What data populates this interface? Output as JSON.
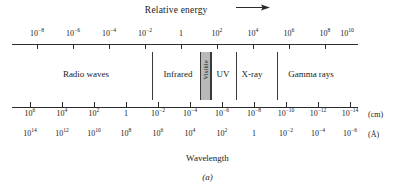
{
  "header": {
    "title": "Relative energy",
    "arrow_icon": "arrow-right-icon"
  },
  "chart_data": {
    "type": "diagram",
    "xlabel": "Wavelength",
    "top_axis": {
      "label": "Relative energy",
      "direction": "increases to the right",
      "tick_labels": [
        "10−8",
        "10−6",
        "10−4",
        "10−2",
        "1",
        "10²",
        "10⁴",
        "10⁶",
        "10⁸",
        "10¹⁰"
      ],
      "tick_bases": [
        "10",
        "10",
        "10",
        "10",
        "1",
        "10",
        "10",
        "10",
        "10",
        "10"
      ],
      "tick_exponents": [
        "-8",
        "-6",
        "-4",
        "-2",
        "",
        "2",
        "4",
        "6",
        "8",
        "10"
      ],
      "tick_x": [
        37,
        73,
        109,
        145,
        181,
        217,
        253,
        289,
        325,
        347
      ]
    },
    "cm_axis": {
      "unit": "(cm)",
      "tick_labels": [
        "10⁶",
        "10⁴",
        "10²",
        "1",
        "10−2",
        "10−4",
        "10−6",
        "10−8",
        "10−10",
        "10−12",
        "10−14"
      ],
      "tick_bases": [
        "10",
        "10",
        "10",
        "1",
        "10",
        "10",
        "10",
        "10",
        "10",
        "10",
        "10"
      ],
      "tick_exponents": [
        "6",
        "4",
        "2",
        "",
        "-2",
        "-4",
        "-6",
        "-8",
        "-10",
        "-12",
        "-14"
      ],
      "tick_x": [
        30,
        62,
        94,
        126,
        158,
        190,
        222,
        254,
        286,
        318,
        350
      ]
    },
    "angstrom_axis": {
      "unit": "(Å)",
      "tick_labels": [
        "10¹⁴",
        "10¹²",
        "10¹⁰",
        "10⁸",
        "10⁶",
        "10⁴",
        "10²",
        "1",
        "10−2",
        "10−4",
        "10−6"
      ],
      "tick_bases": [
        "10",
        "10",
        "10",
        "10",
        "10",
        "10",
        "10",
        "1",
        "10",
        "10",
        "10"
      ],
      "tick_exponents": [
        "14",
        "12",
        "10",
        "8",
        "6",
        "4",
        "2",
        "",
        "-2",
        "-4",
        "-6"
      ],
      "tick_x": [
        30,
        62,
        94,
        126,
        158,
        190,
        222,
        254,
        286,
        318,
        350
      ]
    },
    "bands": [
      {
        "name": "Radio waves",
        "center_x": 86,
        "orientation": "horizontal"
      },
      {
        "name": "Infrared",
        "center_x": 178,
        "orientation": "horizontal"
      },
      {
        "name": "Visible",
        "center_x": 206,
        "orientation": "vertical",
        "shaded": true,
        "color": "#b9b9b9"
      },
      {
        "name": "UV",
        "center_x": 223,
        "orientation": "horizontal"
      },
      {
        "name": "X-ray",
        "center_x": 252,
        "orientation": "horizontal"
      },
      {
        "name": "Gamma rays",
        "center_x": 311,
        "orientation": "horizontal"
      }
    ],
    "dividers_x": [
      152,
      211,
      236,
      277
    ],
    "visible_band": {
      "left_x": 200,
      "width": 9
    }
  },
  "footer": {
    "wavelength_label": "Wavelength",
    "panel_label": "(a)"
  },
  "units": {
    "cm": "(cm)",
    "angstrom": "(Å)"
  }
}
